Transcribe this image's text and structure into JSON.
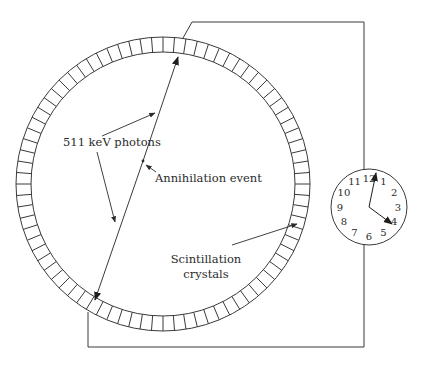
{
  "figure": {
    "colors": {
      "line": "#3a3a3a",
      "text": "#2b2b2b",
      "background": "#ffffff"
    }
  },
  "ring": {
    "center": [
      163,
      184
    ],
    "outer_radius": 147,
    "inner_radius": 132,
    "crystal_count": 80
  },
  "labels": {
    "photons": "511 keV photons",
    "annihilation": "Annihilation event",
    "crystals_line1": "Scintillation",
    "crystals_line2": "crystals"
  },
  "clock": {
    "center": [
      369,
      207
    ],
    "radius": 38,
    "numbers": [
      "12",
      "1",
      "2",
      "3",
      "4",
      "5",
      "6",
      "7",
      "8",
      "9",
      "10",
      "11"
    ],
    "hour_hand_target": "4",
    "minute_hand_target": "12"
  }
}
